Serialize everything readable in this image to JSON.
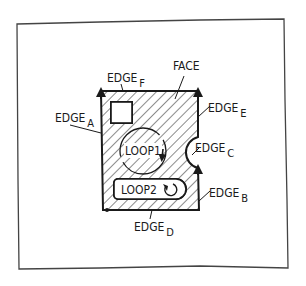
{
  "diagram": {
    "title_labels": {
      "face": "FACE",
      "edges": [
        {
          "id": "A",
          "prefix": "EDGE",
          "sub": "A"
        },
        {
          "id": "B",
          "prefix": "EDGE",
          "sub": "B"
        },
        {
          "id": "C",
          "prefix": "EDGE",
          "sub": "C"
        },
        {
          "id": "D",
          "prefix": "EDGE",
          "sub": "D"
        },
        {
          "id": "E",
          "prefix": "EDGE",
          "sub": "E"
        },
        {
          "id": "F",
          "prefix": "EDGE",
          "sub": "F"
        }
      ],
      "loops": [
        {
          "id": "loop1",
          "label": "LOOP1"
        },
        {
          "id": "loop2",
          "label": "LOOP2"
        }
      ]
    },
    "colors": {
      "stroke": "#1a1a1a",
      "frame": "#444444",
      "background": "#ffffff"
    }
  }
}
